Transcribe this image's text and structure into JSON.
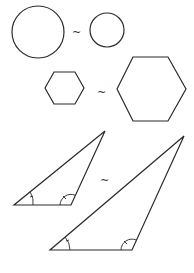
{
  "figure": {
    "similarity_symbol": "~",
    "stroke_color": "#2a2a2a",
    "background": "#ffffff",
    "pairs": [
      {
        "name": "circles",
        "symbol_pos": [
          77,
          34
        ],
        "shapes": [
          {
            "type": "circle",
            "cx": 38,
            "cy": 32,
            "r": 26
          },
          {
            "type": "circle",
            "cx": 107,
            "cy": 30,
            "r": 17
          }
        ]
      },
      {
        "name": "hexagons",
        "symbol_pos": [
          102,
          94
        ],
        "shapes": [
          {
            "type": "hexagon",
            "points": "45,88 54,72 75,72 84,88 75,104 54,104"
          },
          {
            "type": "hexagon",
            "points": "117,89 133,57 168,57 186,89 168,121 133,121"
          }
        ]
      },
      {
        "name": "triangles",
        "symbol_pos": [
          105,
          182
        ],
        "shapes": [
          {
            "type": "triangle",
            "points": "105,131 14,205 71,205"
          },
          {
            "type": "triangle",
            "points": "184,136 50,250 132,250"
          }
        ]
      }
    ]
  }
}
